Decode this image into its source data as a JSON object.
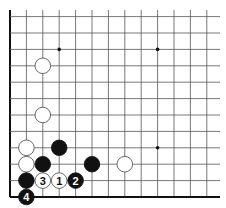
{
  "diagram": {
    "type": "go-board-fragment",
    "corner": "bottom-left",
    "grid": {
      "columns": 13,
      "rows": 12,
      "origin_x": 10,
      "bottom_y": 197,
      "spacing": 16.4,
      "line_color": "#555555",
      "edge_color": "#111111"
    },
    "star_points": [
      {
        "col": 3,
        "row": 9
      },
      {
        "col": 9,
        "row": 9
      },
      {
        "col": 9,
        "row": 3
      }
    ],
    "stones": [
      {
        "color": "white",
        "col": 2,
        "row": 8,
        "label": ""
      },
      {
        "color": "white",
        "col": 2,
        "row": 5,
        "label": ""
      },
      {
        "color": "white",
        "col": 1,
        "row": 3,
        "label": ""
      },
      {
        "color": "black",
        "col": 3,
        "row": 3,
        "label": ""
      },
      {
        "color": "white",
        "col": 1,
        "row": 2,
        "label": ""
      },
      {
        "color": "black",
        "col": 2,
        "row": 2,
        "label": ""
      },
      {
        "color": "black",
        "col": 5,
        "row": 2,
        "label": ""
      },
      {
        "color": "white",
        "col": 7,
        "row": 2,
        "label": ""
      },
      {
        "color": "black",
        "col": 1,
        "row": 1,
        "label": ""
      },
      {
        "color": "white",
        "col": 2,
        "row": 1,
        "label": "3"
      },
      {
        "color": "white",
        "col": 3,
        "row": 1,
        "label": "1"
      },
      {
        "color": "black",
        "col": 4,
        "row": 1,
        "label": "2"
      },
      {
        "color": "black",
        "col": 1,
        "row": 0,
        "label": "4"
      }
    ],
    "colors": {
      "black_stone": "#111111",
      "white_stone": "#ffffff",
      "white_stroke": "#444444"
    }
  }
}
